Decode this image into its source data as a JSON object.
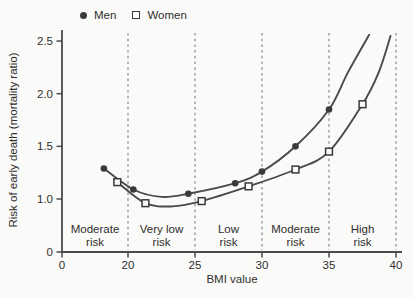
{
  "figure": {
    "background": "#fafaf8",
    "ink": "#4a4a4a",
    "marker_ink": "#3a3a3a",
    "text_color": "#2f2f2f",
    "dash_color": "#8c8c8c"
  },
  "chart_data": {
    "type": "line",
    "title": "",
    "xlabel": "BMI value",
    "ylabel": "Risk of early death (mortality ratio)",
    "x_ticks": [
      0,
      20,
      25,
      30,
      35,
      40
    ],
    "x_tick_labels": [
      "0",
      "20",
      "25",
      "30",
      "35",
      "40"
    ],
    "y_ticks": [
      0,
      1.0,
      1.5,
      2.0,
      2.5
    ],
    "y_tick_labels": [
      "0",
      "1.0",
      "1.5",
      "2.0",
      "2.5"
    ],
    "xlim": [
      0,
      40
    ],
    "ylim": [
      0,
      2.5
    ],
    "axis_note": "both axes are compressed (broken) between 0 and the first labeled region",
    "grid": "vertical dashed zone boundaries only",
    "legend_position": "top-left above plot",
    "dashed_boundaries": [
      20,
      25,
      30,
      35,
      40
    ],
    "zones": [
      {
        "from": 0,
        "to": 20,
        "label_line1": "Moderate",
        "label_line2": "risk"
      },
      {
        "from": 20,
        "to": 25,
        "label_line1": "Very low",
        "label_line2": "risk"
      },
      {
        "from": 25,
        "to": 30,
        "label_line1": "Low",
        "label_line2": "risk"
      },
      {
        "from": 30,
        "to": 35,
        "label_line1": "Moderate",
        "label_line2": "risk"
      },
      {
        "from": 35,
        "to": 40,
        "label_line1": "High",
        "label_line2": "risk"
      }
    ],
    "legend": [
      {
        "name": "Men",
        "marker": "filled-circle"
      },
      {
        "name": "Women",
        "marker": "open-square"
      }
    ],
    "series": [
      {
        "name": "Men",
        "marker": "filled-circle",
        "points": [
          [
            18.2,
            1.29
          ],
          [
            20.4,
            1.09
          ],
          [
            24.5,
            1.05
          ],
          [
            28,
            1.15
          ],
          [
            30,
            1.26
          ],
          [
            32.5,
            1.5
          ],
          [
            35,
            1.85
          ]
        ],
        "curve": [
          [
            18.2,
            1.29
          ],
          [
            20.4,
            1.09
          ],
          [
            22.5,
            1.02
          ],
          [
            24.5,
            1.05
          ],
          [
            28,
            1.15
          ],
          [
            30,
            1.26
          ],
          [
            32.5,
            1.5
          ],
          [
            35,
            1.85
          ],
          [
            36.4,
            2.2
          ],
          [
            38,
            2.56
          ]
        ]
      },
      {
        "name": "Women",
        "marker": "open-square",
        "points": [
          [
            19.2,
            1.16
          ],
          [
            21.3,
            0.96
          ],
          [
            25.5,
            0.98
          ],
          [
            29,
            1.12
          ],
          [
            32.5,
            1.28
          ],
          [
            35,
            1.45
          ],
          [
            37.5,
            1.9
          ]
        ],
        "curve": [
          [
            19.2,
            1.16
          ],
          [
            21.3,
            0.96
          ],
          [
            23.3,
            0.93
          ],
          [
            25.5,
            0.98
          ],
          [
            29,
            1.12
          ],
          [
            32.5,
            1.28
          ],
          [
            35,
            1.45
          ],
          [
            37.5,
            1.9
          ],
          [
            38.7,
            2.2
          ],
          [
            39.6,
            2.55
          ]
        ]
      }
    ]
  }
}
